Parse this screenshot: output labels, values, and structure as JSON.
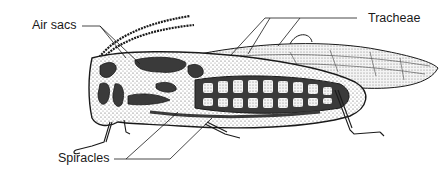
{
  "figure": {
    "labels": {
      "air_sacs": "Air sacs",
      "tracheae": "Tracheae",
      "spiracles": "Spiracles"
    },
    "colors": {
      "ink": "#1a1a1a",
      "dark_fill": "#3a3a3a",
      "stipple": "#d8d8d8",
      "background": "#ffffff"
    }
  }
}
